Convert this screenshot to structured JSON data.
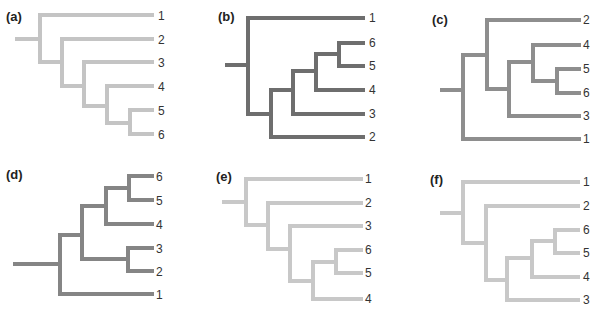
{
  "figure": {
    "panels": [
      {
        "id": "a",
        "label": "(a)",
        "color": "#c4c4c4",
        "newick": "(1,(2,(3,(4,(5,6)))))",
        "leaves": [
          "1",
          "2",
          "3",
          "4",
          "5",
          "6"
        ]
      },
      {
        "id": "b",
        "label": "(b)",
        "color": "#6e6e6e",
        "newick": "(1,(((( 6,5),4),3),2))",
        "leaves": [
          "1",
          "6",
          "5",
          "4",
          "3",
          "2"
        ]
      },
      {
        "id": "c",
        "label": "(c)",
        "color": "#8e8e8e",
        "newick": "((2,((4,(5,6)),3)),1)",
        "leaves": [
          "2",
          "4",
          "5",
          "6",
          "3",
          "1"
        ]
      },
      {
        "id": "d",
        "label": "(d)",
        "color": "#858585",
        "newick": "((((6,5),4),(3,2)),1)",
        "leaves": [
          "6",
          "5",
          "4",
          "3",
          "2",
          "1"
        ]
      },
      {
        "id": "e",
        "label": "(e)",
        "color": "#c8c8c8",
        "newick": "(1,(2,(3,((6,5),4))))",
        "leaves": [
          "1",
          "2",
          "3",
          "6",
          "5",
          "4"
        ]
      },
      {
        "id": "f",
        "label": "(f)",
        "color": "#c8c8c8",
        "newick": "(1,(2,(((6,5),4),3)))",
        "leaves": [
          "1",
          "2",
          "6",
          "5",
          "4",
          "3"
        ]
      }
    ]
  }
}
